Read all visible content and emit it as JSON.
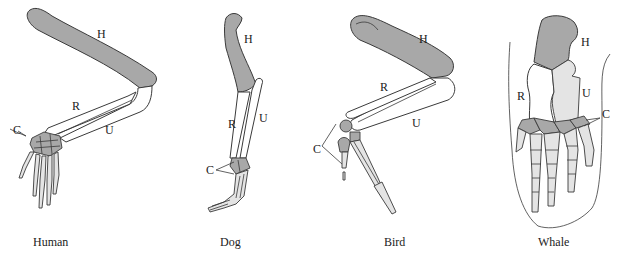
{
  "figure": {
    "colors": {
      "humerus": "#a8a8a8",
      "radius_ulna": "#ffffff",
      "carpals": "#a8a8a8",
      "phalanges": "#e4e4e4",
      "outline": "#3a3a3a"
    },
    "panels": [
      {
        "id": "human",
        "caption": "Human",
        "labels": {
          "humerus": "H",
          "radius": "R",
          "ulna": "U",
          "carpals": "C"
        }
      },
      {
        "id": "dog",
        "caption": "Dog",
        "labels": {
          "humerus": "H",
          "radius": "R",
          "ulna": "U",
          "carpals": "C"
        }
      },
      {
        "id": "bird",
        "caption": "Bird",
        "labels": {
          "humerus": "H",
          "radius": "R",
          "ulna": "U",
          "carpals": "C"
        }
      },
      {
        "id": "whale",
        "caption": "Whale",
        "labels": {
          "humerus": "H",
          "radius": "R",
          "ulna": "U",
          "carpals": "C"
        }
      }
    ]
  }
}
